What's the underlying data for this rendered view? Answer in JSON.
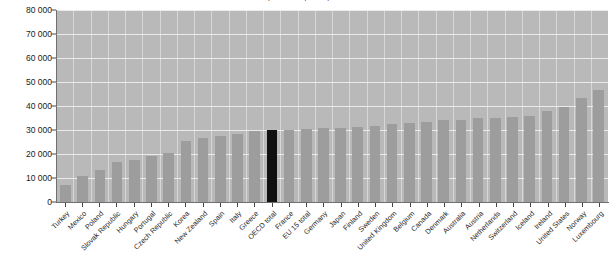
{
  "chart_data": {
    "type": "bar",
    "title": "Health expenditure per capita, US$ PPP",
    "xlabel": "",
    "ylabel": "",
    "ylim": [
      0,
      80000
    ],
    "ytick_labels": [
      "80 000",
      "70 000",
      "60 000",
      "50 000",
      "40 000",
      "30 000",
      "20 000",
      "10 000",
      "0"
    ],
    "ytick_values": [
      80000,
      70000,
      60000,
      50000,
      40000,
      30000,
      20000,
      10000,
      0
    ],
    "grid": true,
    "legend": "none",
    "highlight_category": "OECD total",
    "colors": {
      "bar": "#9d9d9d",
      "highlight_bar": "#111111",
      "plot_background": "#b9b9b9",
      "gridline": "#f2f2f2",
      "axis": "#6f6f6f",
      "text": "#1a1a1a"
    },
    "categories": [
      "Turkey",
      "Mexico",
      "Poland",
      "Slovak Republic",
      "Hungary",
      "Portugal",
      "Czech Republic",
      "Korea",
      "New Zealand",
      "Spain",
      "Italy",
      "Greece",
      "OECD total",
      "France",
      "EU 15 total",
      "Germany",
      "Japan",
      "Finland",
      "Sweden",
      "United Kingdom",
      "Belgium",
      "Canada",
      "Denmark",
      "Australia",
      "Austria",
      "Netherlands",
      "Switzerland",
      "Iceland",
      "Ireland",
      "United States",
      "Norway",
      "Luxembourg"
    ],
    "values": [
      7000,
      11000,
      13500,
      16500,
      17500,
      19000,
      20500,
      25500,
      26500,
      27500,
      28500,
      29500,
      29800,
      30200,
      30500,
      30800,
      31000,
      31200,
      31500,
      32500,
      33000,
      33200,
      34000,
      34200,
      35000,
      35200,
      35500,
      35800,
      38000,
      39500,
      43500,
      46500
    ]
  }
}
